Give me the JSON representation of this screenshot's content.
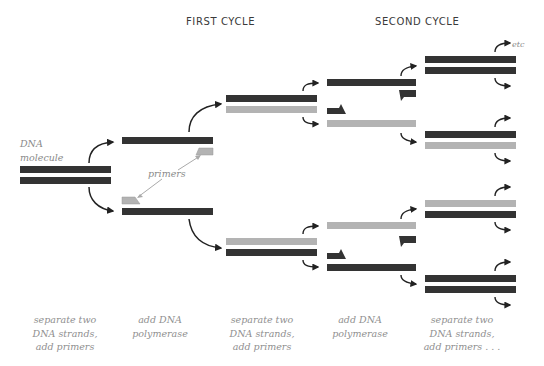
{
  "titles": {
    "first_cycle": "FIRST CYCLE",
    "second_cycle": "SECOND CYCLE"
  },
  "labels": {
    "dna_molecule_line1": "DNA",
    "dna_molecule_line2": "molecule",
    "primers": "primers",
    "etc": "etc"
  },
  "colors": {
    "dark_strand": "#333333",
    "light_strand": "#b3b3b3",
    "arrow": "#222222",
    "pointer": "#aaaaaa"
  },
  "captions": [
    {
      "lines": [
        "separate two",
        "DNA strands,",
        "add primers"
      ]
    },
    {
      "lines": [
        "add DNA",
        "polymerase"
      ]
    },
    {
      "lines": [
        "separate two",
        "DNA strands,",
        "add primers"
      ]
    },
    {
      "lines": [
        "add DNA",
        "polymerase"
      ]
    },
    {
      "lines": [
        "separate two",
        "DNA strands,",
        "add primers . . ."
      ]
    }
  ],
  "stages": [
    {
      "name": "dna-molecule",
      "strands": [
        {
          "color": "dark"
        },
        {
          "color": "dark"
        }
      ]
    },
    {
      "name": "cycle1-separated",
      "strands": [
        {
          "color": "dark",
          "primer": "light"
        },
        {
          "color": "dark",
          "primer": "light"
        }
      ]
    },
    {
      "name": "cycle1-products",
      "pairs": [
        [
          "dark",
          "light"
        ],
        [
          "light",
          "dark"
        ]
      ]
    },
    {
      "name": "cycle2-separated",
      "strands": [
        {
          "color": "dark",
          "primer": "dark"
        },
        {
          "color": "light",
          "primer": "dark"
        },
        {
          "color": "light",
          "primer": "dark"
        },
        {
          "color": "dark",
          "primer": "dark"
        }
      ]
    },
    {
      "name": "cycle2-products",
      "pairs": [
        [
          "dark",
          "dark"
        ],
        [
          "dark",
          "light"
        ],
        [
          "light",
          "dark"
        ],
        [
          "dark",
          "dark"
        ]
      ]
    }
  ]
}
